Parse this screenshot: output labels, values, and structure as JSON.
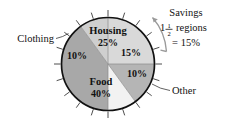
{
  "chart_data": {
    "type": "pie",
    "title": "",
    "total": 100,
    "units": "%",
    "start_angle_deg": 0,
    "direction": "clockwise",
    "tick_interval_pct": 5,
    "tick_count": 20,
    "categories": [
      "Housing",
      "Savings",
      "Other",
      "Food",
      "Clothing"
    ],
    "values": [
      25,
      15,
      10,
      40,
      10
    ],
    "slices": [
      {
        "name": "Housing",
        "value": 25,
        "label": "Housing",
        "pct_label": "25%",
        "color": "#d9d9d9",
        "label_placement": "inside",
        "start_pct": 0,
        "end_pct": 25
      },
      {
        "name": "Savings",
        "value": 15,
        "label": "",
        "pct_label": "15%",
        "color": "#b5b5b5",
        "label_placement": "inside-pct-only",
        "start_pct": 25,
        "end_pct": 40
      },
      {
        "name": "Other",
        "value": 10,
        "label": "Other",
        "pct_label": "10%",
        "color": "#f2f2f2",
        "label_placement": "callout-right",
        "start_pct": 40,
        "end_pct": 50
      },
      {
        "name": "Food",
        "value": 40,
        "label": "Food",
        "pct_label": "40%",
        "color": "#a8a8a8",
        "label_placement": "inside",
        "start_pct": 50,
        "end_pct": 90
      },
      {
        "name": "Clothing",
        "value": 10,
        "label": "Clothing",
        "pct_label": "10%",
        "color": "#cfcfcf",
        "label_placement": "callout-left",
        "start_pct": 90,
        "end_pct": 100
      }
    ],
    "legend_position": "none",
    "grid": false
  },
  "callouts": {
    "clothing": "Clothing",
    "other": "Other"
  },
  "annotation": {
    "title": "Savings",
    "whole": "1",
    "frac_numerator": "1",
    "frac_denominator": "2",
    "regions_word": "regions",
    "result": "= 15%",
    "bracket_start_pct": 25,
    "bracket_end_pct": 40
  },
  "colors": {
    "outline": "#111111",
    "tick": "#3a3a3a",
    "leader": "#3a3a3a",
    "bracket": "#9a9a9a",
    "text": "#111111",
    "background": "#ffffff"
  }
}
